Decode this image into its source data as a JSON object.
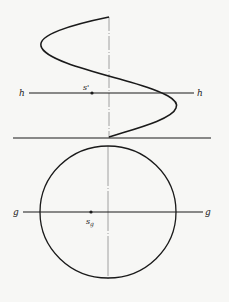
{
  "figure": {
    "labels": {
      "h_left": "h",
      "h_right": "h",
      "g_left": "g",
      "g_right": "g",
      "s_prime": "s'",
      "s_g_base": "s",
      "s_g_sub": "g"
    },
    "colors": {
      "ink": "#1a1a1a",
      "axis": "#8a8a8a",
      "background": "#f7f7f5"
    }
  }
}
